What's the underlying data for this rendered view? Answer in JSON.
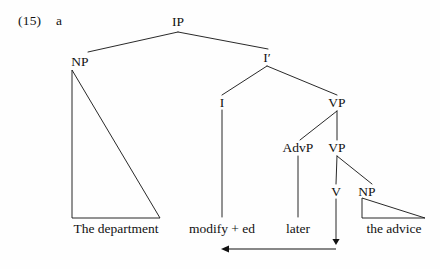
{
  "figure": {
    "example_number": "(15)",
    "example_letter": "a",
    "type": "syntax-tree-diagram",
    "ink_color": "#111111",
    "background_color": "#fefefe"
  },
  "nodes": [
    {
      "id": "IP",
      "label": "IP",
      "x": 178,
      "y": 22
    },
    {
      "id": "NP1",
      "label": "NP",
      "x": 80,
      "y": 62
    },
    {
      "id": "Ibar",
      "label": "I′",
      "x": 267,
      "y": 58
    },
    {
      "id": "I",
      "label": "I",
      "x": 222,
      "y": 103
    },
    {
      "id": "VP1",
      "label": "VP",
      "x": 337,
      "y": 103
    },
    {
      "id": "AdvP",
      "label": "AdvP",
      "x": 298,
      "y": 148
    },
    {
      "id": "VP2",
      "label": "VP",
      "x": 337,
      "y": 148
    },
    {
      "id": "V",
      "label": "V",
      "x": 336,
      "y": 192
    },
    {
      "id": "NP2",
      "label": "NP",
      "x": 367,
      "y": 192
    }
  ],
  "terminals": [
    {
      "id": "t-np1",
      "label": "The department",
      "x": 116,
      "y": 229
    },
    {
      "id": "t-i",
      "label": "modify + ed",
      "x": 222,
      "y": 229
    },
    {
      "id": "t-advp",
      "label": "later",
      "x": 298,
      "y": 229
    },
    {
      "id": "t-np2",
      "label": "the advice",
      "x": 394,
      "y": 229
    }
  ],
  "branches": [
    {
      "from": "IP",
      "to": "NP1",
      "x1": 178,
      "y1": 32,
      "x2": 88,
      "y2": 52
    },
    {
      "from": "IP",
      "to": "Ibar",
      "x1": 178,
      "y1": 32,
      "x2": 268,
      "y2": 49
    },
    {
      "from": "Ibar",
      "to": "I",
      "x1": 267,
      "y1": 66,
      "x2": 222,
      "y2": 95
    },
    {
      "from": "Ibar",
      "to": "VP1",
      "x1": 267,
      "y1": 66,
      "x2": 337,
      "y2": 95
    },
    {
      "from": "VP1",
      "to": "AdvP",
      "x1": 337,
      "y1": 111,
      "x2": 300,
      "y2": 140
    },
    {
      "from": "VP1",
      "to": "VP2",
      "x1": 337,
      "y1": 111,
      "x2": 337,
      "y2": 140
    },
    {
      "from": "VP2",
      "to": "V",
      "x1": 337,
      "y1": 156,
      "x2": 336,
      "y2": 184
    },
    {
      "from": "VP2",
      "to": "NP2",
      "x1": 337,
      "y1": 156,
      "x2": 372,
      "y2": 184
    },
    {
      "from": "I",
      "to": "t-i",
      "x1": 222,
      "y1": 110,
      "x2": 222,
      "y2": 217
    },
    {
      "from": "AdvP",
      "to": "t-advp",
      "x1": 298,
      "y1": 156,
      "x2": 298,
      "y2": 217
    },
    {
      "from": "V",
      "to": "v-trace",
      "x1": 336,
      "y1": 199,
      "x2": 336,
      "y2": 243
    }
  ],
  "triangles": [
    {
      "id": "tri-np1",
      "for": "NP1",
      "apex_x": 72,
      "apex_y": 70,
      "left_x": 72,
      "base_y": 218,
      "right_x": 160
    },
    {
      "id": "tri-np2",
      "for": "NP2",
      "apex_x": 362,
      "apex_y": 198,
      "left_x": 362,
      "base_y": 218,
      "right_x": 425
    }
  ],
  "movement_arrow": {
    "label": "verb-movement-arrow",
    "from_x": 336,
    "from_y": 243,
    "corner_x": 336,
    "corner_y": 249,
    "to_x": 222,
    "to_y": 249,
    "head_at": "left"
  }
}
